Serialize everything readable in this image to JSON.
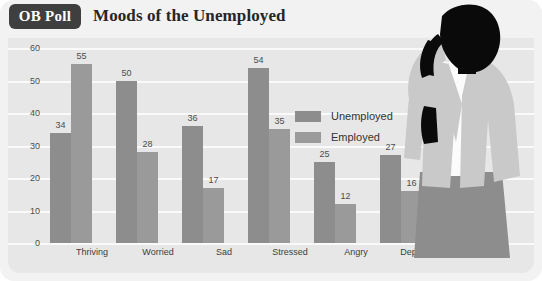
{
  "header": {
    "badge": "OB Poll",
    "title": "Moods of the Unemployed"
  },
  "legend": {
    "items": [
      {
        "label": "Unemployed",
        "color": "#8d8d8d"
      },
      {
        "label": "Employed",
        "color": "#9a9a9a"
      }
    ]
  },
  "yticks": [
    "60",
    "50",
    "40",
    "30",
    "20",
    "10",
    "0"
  ],
  "figure": {
    "name": "stressed-woman-silhouette",
    "hair_color": "#0a0a0a",
    "jacket_color": "#c9c9c9",
    "shirt_color": "#fbfbfb",
    "skirt_color": "#8d8d8d"
  },
  "chart_data": {
    "type": "bar",
    "title": "Moods of the Unemployed",
    "xlabel": "",
    "ylabel": "",
    "ylim": [
      0,
      60
    ],
    "yticks": [
      0,
      10,
      20,
      30,
      40,
      50,
      60
    ],
    "grid": true,
    "legend_position": "inside-top-right",
    "categories": [
      "Thriving",
      "Worried",
      "Sad",
      "Stressed",
      "Angry",
      "Depressed"
    ],
    "series": [
      {
        "name": "Unemployed",
        "color": "#8d8d8d",
        "values": [
          34,
          50,
          36,
          54,
          25,
          27
        ]
      },
      {
        "name": "Employed",
        "color": "#9a9a9a",
        "values": [
          55,
          28,
          17,
          35,
          12,
          16
        ]
      }
    ]
  }
}
